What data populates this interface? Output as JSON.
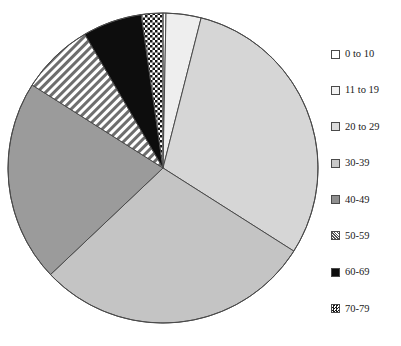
{
  "chart_data": {
    "type": "pie",
    "title": "",
    "subtitle": "",
    "xlabel": "",
    "ylabel": "",
    "grid": false,
    "legend_position": "right",
    "start_angle_deg": 0,
    "direction": "clockwise",
    "categories": [
      "0 to 10",
      "11 to 19",
      "20 to 29",
      "30-39",
      "40-49",
      "50-59",
      "60-69",
      "70-79"
    ],
    "values": [
      0.3,
      3.6,
      29.7,
      28.6,
      20.8,
      7.5,
      6.1,
      2.2
    ],
    "unit": "percent",
    "slices": [
      {
        "label": "0 to 10",
        "value": 0.3,
        "angle_deg": 1.1,
        "start_deg": 0,
        "end_deg": 1.1,
        "fill": "#ffffff",
        "pattern": "solid",
        "stroke": "#4a4a4a"
      },
      {
        "label": "11 to 19",
        "value": 3.6,
        "angle_deg": 13.0,
        "start_deg": 1.1,
        "end_deg": 14.1,
        "fill": "#eeeeee",
        "pattern": "solid",
        "stroke": "#4a4a4a"
      },
      {
        "label": "20 to 29",
        "value": 29.7,
        "angle_deg": 107.0,
        "start_deg": 14.1,
        "end_deg": 121.1,
        "fill": "#d6d6d6",
        "pattern": "solid",
        "stroke": "#4a4a4a"
      },
      {
        "label": "30-39",
        "value": 28.6,
        "angle_deg": 103.0,
        "start_deg": 121.1,
        "end_deg": 224.1,
        "fill": "#c4c4c4",
        "pattern": "solid",
        "stroke": "#4a4a4a"
      },
      {
        "label": "40-49",
        "value": 20.8,
        "angle_deg": 75.0,
        "start_deg": 224.1,
        "end_deg": 299.1,
        "fill": "#9b9b9b",
        "pattern": "solid",
        "stroke": "#4a4a4a"
      },
      {
        "label": "50-59",
        "value": 7.5,
        "angle_deg": 27.0,
        "start_deg": 299.1,
        "end_deg": 326.1,
        "fill": "#ffffff",
        "pattern": "diagonal-stripes",
        "stroke": "#4a4a4a"
      },
      {
        "label": "60-69",
        "value": 6.1,
        "angle_deg": 22.0,
        "start_deg": 326.1,
        "end_deg": 348.1,
        "fill": "#0d0d0d",
        "pattern": "solid",
        "stroke": "#4a4a4a"
      },
      {
        "label": "70-79",
        "value": 2.2,
        "angle_deg": 8.0,
        "start_deg": 348.1,
        "end_deg": 356.1,
        "fill": "#ffffff",
        "pattern": "checker-dots",
        "stroke": "#4a4a4a"
      }
    ]
  },
  "legend": {
    "items": [
      {
        "label": "0 to 10",
        "swatch_fill": "#ffffff",
        "swatch_pattern": "solid"
      },
      {
        "label": "11 to 19",
        "swatch_fill": "#f2f2f2",
        "swatch_pattern": "solid"
      },
      {
        "label": "20 to 29",
        "swatch_fill": "#dcdcdc",
        "swatch_pattern": "solid"
      },
      {
        "label": "30-39",
        "swatch_fill": "#c9c9c9",
        "swatch_pattern": "solid"
      },
      {
        "label": "40-49",
        "swatch_fill": "#8f8f8f",
        "swatch_pattern": "solid"
      },
      {
        "label": "50-59",
        "swatch_fill": "#ffffff",
        "swatch_pattern": "diagonal-stripes"
      },
      {
        "label": "60-69",
        "swatch_fill": "#0d0d0d",
        "swatch_pattern": "solid"
      },
      {
        "label": "70-79",
        "swatch_fill": "#ffffff",
        "swatch_pattern": "checker-dots"
      }
    ]
  },
  "geometry": {
    "center_x": 163,
    "center_y": 168,
    "radius": 155
  },
  "colors": {
    "outline": "#4a4a4a",
    "text": "#1a1a1a",
    "background": "#ffffff"
  }
}
